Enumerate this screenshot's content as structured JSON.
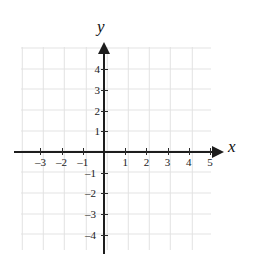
{
  "chart_data": {
    "type": "scatter",
    "title": "",
    "xlabel": "x",
    "ylabel": "y",
    "xlim": [
      -3.9,
      5.1
    ],
    "ylim": [
      -4.9,
      4.9
    ],
    "grid": true,
    "legend": null,
    "series": [],
    "x_ticks": [
      {
        "value": -3,
        "label": "–3"
      },
      {
        "value": -2,
        "label": "–2"
      },
      {
        "value": -1,
        "label": "–1"
      },
      {
        "value": 1,
        "label": "1"
      },
      {
        "value": 2,
        "label": "2"
      },
      {
        "value": 3,
        "label": "3"
      },
      {
        "value": 4,
        "label": "4"
      },
      {
        "value": 5,
        "label": "5"
      }
    ],
    "y_ticks": [
      {
        "value": 4,
        "label": "4"
      },
      {
        "value": 3,
        "label": "3"
      },
      {
        "value": 2,
        "label": "2"
      },
      {
        "value": 1,
        "label": "1"
      },
      {
        "value": -1,
        "label": "–1"
      },
      {
        "value": -2,
        "label": "–2"
      },
      {
        "value": -3,
        "label": "–3"
      },
      {
        "value": -4,
        "label": "–4"
      }
    ],
    "annotations": [],
    "colors": {
      "axis": "#1d1d1d",
      "grid": "#d8d8d8",
      "background": "#ffffff",
      "text": "#1a1a1a"
    }
  },
  "axes": {
    "x_name": "x",
    "y_name": "y"
  }
}
